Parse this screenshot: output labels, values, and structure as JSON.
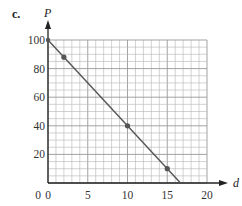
{
  "panel_label": "c.",
  "chart_data": {
    "type": "scatter",
    "title": "",
    "xlabel": "d",
    "ylabel": "P",
    "xlim": [
      0,
      20
    ],
    "ylim": [
      0,
      100
    ],
    "x_ticks": [
      0,
      5,
      10,
      15,
      20
    ],
    "y_ticks": [
      20,
      40,
      60,
      80,
      100
    ],
    "x_tick_labels": [
      "0",
      "5",
      "10",
      "15",
      "20"
    ],
    "y_tick_labels": [
      "20",
      "40",
      "60",
      "80",
      "100"
    ],
    "grid": true,
    "grid_minor_x": 1,
    "grid_minor_y": 5,
    "series": [
      {
        "name": "points",
        "x": [
          2,
          10,
          15
        ],
        "y": [
          88,
          40,
          10
        ]
      },
      {
        "name": "fit-line",
        "type": "line",
        "x": [
          0,
          16.67
        ],
        "y": [
          100,
          0
        ]
      }
    ],
    "colors": {
      "line": "#555555",
      "grid": "#b5b5b5",
      "axis": "#222222",
      "point": "#555555"
    }
  }
}
